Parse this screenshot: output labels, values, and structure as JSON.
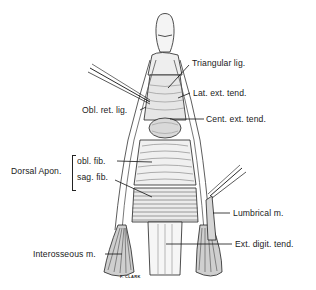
{
  "figure": {
    "signature": "F. CLARK"
  },
  "labels": {
    "triangular_lig": "Triangular lig.",
    "lat_ext_tend": "Lat. ext. tend.",
    "obl_ret_lig": "Obl. ret. lig.",
    "cent_ext_tend": "Cent. ext. tend.",
    "dorsal_apon": "Dorsal Apon.",
    "obl_fib": "obl. fib.",
    "sag_fib": "sag. fib.",
    "lumbrical_m": "Lumbrical m.",
    "interosseous_m": "Interosseous m.",
    "ext_digit_tend": "Ext. digit. tend."
  },
  "colors": {
    "ink": "#1a1a1a",
    "background": "#ffffff",
    "shade": "#b8b8b8"
  }
}
